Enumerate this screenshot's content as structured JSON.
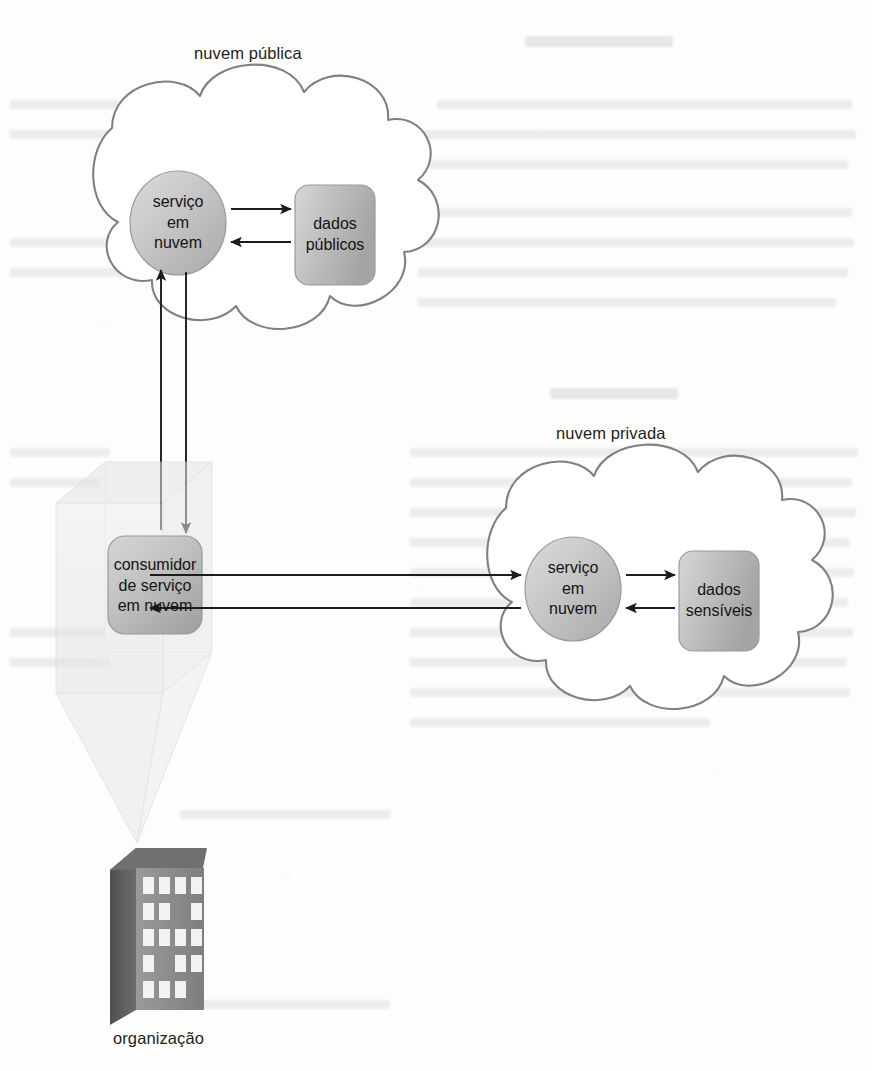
{
  "figure": {
    "kind": "cloud-architecture-diagram",
    "language": "pt-BR",
    "clouds": [
      {
        "id": "public-cloud",
        "label": "nuvem pública",
        "nodes": [
          {
            "id": "public-cloud-service",
            "shape": "ellipse",
            "label_lines": [
              "serviço",
              "em",
              "nuvem"
            ]
          },
          {
            "id": "public-data-store",
            "shape": "cylinder",
            "label_lines": [
              "dados",
              "públicos"
            ]
          }
        ]
      },
      {
        "id": "private-cloud",
        "label": "nuvem privada",
        "nodes": [
          {
            "id": "private-cloud-service",
            "shape": "ellipse",
            "label_lines": [
              "serviço",
              "em",
              "nuvem"
            ]
          },
          {
            "id": "private-data-store",
            "shape": "cylinder",
            "label_lines": [
              "dados",
              "sensíveis"
            ]
          }
        ]
      }
    ],
    "consumer": {
      "id": "cloud-service-consumer",
      "shape": "rounded-rect",
      "label_lines": [
        "consumidor",
        "de serviço",
        "em nuvem"
      ]
    },
    "organization": {
      "id": "organization",
      "shape": "building",
      "label": "organização"
    },
    "connections": [
      {
        "id": "pubsvc-to-pubdata",
        "from": "public-cloud-service",
        "to": "public-data-store",
        "direction": "forward"
      },
      {
        "id": "pubdata-to-pubsvc",
        "from": "public-data-store",
        "to": "public-cloud-service",
        "direction": "forward"
      },
      {
        "id": "consumer-to-pubsvc",
        "from": "cloud-service-consumer",
        "to": "public-cloud-service",
        "direction": "up"
      },
      {
        "id": "pubsvc-to-consumer",
        "from": "public-cloud-service",
        "to": "cloud-service-consumer",
        "direction": "down"
      },
      {
        "id": "consumer-to-privsvc",
        "from": "cloud-service-consumer",
        "to": "private-cloud-service",
        "direction": "right"
      },
      {
        "id": "privsvc-to-consumer",
        "from": "private-cloud-service",
        "to": "cloud-service-consumer",
        "direction": "left"
      },
      {
        "id": "privsvc-to-privdata",
        "from": "private-cloud-service",
        "to": "private-data-store",
        "direction": "right"
      },
      {
        "id": "privdata-to-privsvc",
        "from": "private-data-store",
        "to": "private-cloud-service",
        "direction": "left"
      }
    ]
  },
  "colors": {
    "page_background": "#ffffff",
    "cloud_outline": "#808080",
    "node_fill_light": "#d2d2d2",
    "node_fill_dark": "#a9a9a9",
    "node_outline": "#8c8c8c",
    "arrow": "#1c1c1c",
    "text": "#1d1d1d",
    "building_front": "#8d8d8d",
    "building_side": "#5d5d5d",
    "building_window": "#f2f2f2",
    "prism_fill": "#e9e9e9",
    "prism_edge": "#cfcfcf"
  }
}
